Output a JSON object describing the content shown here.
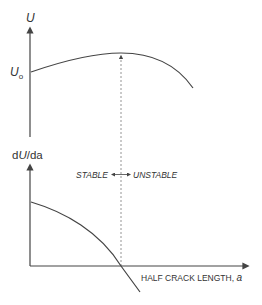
{
  "colors": {
    "line": "#444444",
    "dashed": "#888888",
    "text": "#333333",
    "background": "#ffffff"
  },
  "top_plot": {
    "y_axis_label": "U",
    "y_intercept_label_base": "U",
    "y_intercept_label_sub": "o",
    "curve_description": "energy U rises from U_o to a maximum then falls"
  },
  "bottom_plot": {
    "y_axis_label_prefix": "d",
    "y_axis_label_italic": "U",
    "y_axis_label_suffix": "/da",
    "x_axis_label_text": "HALF CRACK LENGTH, ",
    "x_axis_label_var": "a",
    "curve_description": "dU/da decreases, crossing zero at the maximum of U"
  },
  "annotation": {
    "stable_label": "STABLE",
    "unstable_label": "UNSTABLE"
  }
}
